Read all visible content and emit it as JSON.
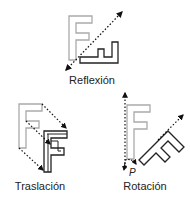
{
  "diagram": {
    "panels": [
      {
        "id": "reflexion",
        "label": "Reflexión"
      },
      {
        "id": "traslacion",
        "label": "Traslación"
      },
      {
        "id": "rotacion",
        "label": "Rotación",
        "pivot_label": "P"
      }
    ]
  },
  "colors": {
    "original_stroke": "#aaaaaa",
    "transformed_stroke": "#222222",
    "guide_stroke": "#111111",
    "background": "#ffffff"
  }
}
